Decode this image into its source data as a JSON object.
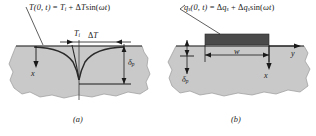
{
  "figure": {
    "width": 316,
    "height": 136,
    "background": "#ffffff",
    "medium_fill": "#c9c9c9",
    "medium_stroke": "#8a8a8a",
    "line_color": "#1a1a1a",
    "heater_fill": "#4a4a4a"
  },
  "panel_a": {
    "caption": "(a)",
    "boundary_condition_label": "T(0, t) = Ti + ΔT sin(ωt)",
    "equation": {
      "lhs_fn": "T",
      "lhs_args": "(0, t)",
      "equals": "=",
      "term1_symbol": "T",
      "term1_sub": "i",
      "plus": "+",
      "term2_delta": "Δ",
      "term2_symbol": "T",
      "term2_trig": "sin(",
      "term2_omega": "ω",
      "term2_t": "t",
      "term2_close": ")"
    },
    "labels": {
      "surface_temp": "T",
      "surface_temp_sub": "i",
      "amplitude_delta": "Δ",
      "amplitude_symbol": "T",
      "depth_symbol": "δ",
      "depth_sub": "p",
      "axis_x": "x"
    },
    "description": "Semi-infinite medium with sinusoidally varying surface temperature; damped thermal wave profiles decay with depth."
  },
  "panel_b": {
    "caption": "(b)",
    "boundary_condition_label": "qs(0, t) = Δqs + Δqs sin(ωt)",
    "equation": {
      "lhs_fn": "q",
      "lhs_sub": "s",
      "lhs_args": "(0, t)",
      "equals": "=",
      "term1_delta": "Δ",
      "term1_symbol": "q",
      "term1_sub": "s",
      "plus": "+",
      "term2_delta": "Δ",
      "term2_symbol": "q",
      "term2_sub": "s",
      "term2_trig": "sin(",
      "term2_omega": "ω",
      "term2_t": "t",
      "term2_close": ")"
    },
    "labels": {
      "heater_width": "w",
      "depth_symbol": "δ",
      "depth_sub": "p",
      "axis_x": "x",
      "axis_y": "y"
    },
    "description": "Strip heater of width w on a semi-infinite medium with sinusoidally varying surface heat flux."
  }
}
